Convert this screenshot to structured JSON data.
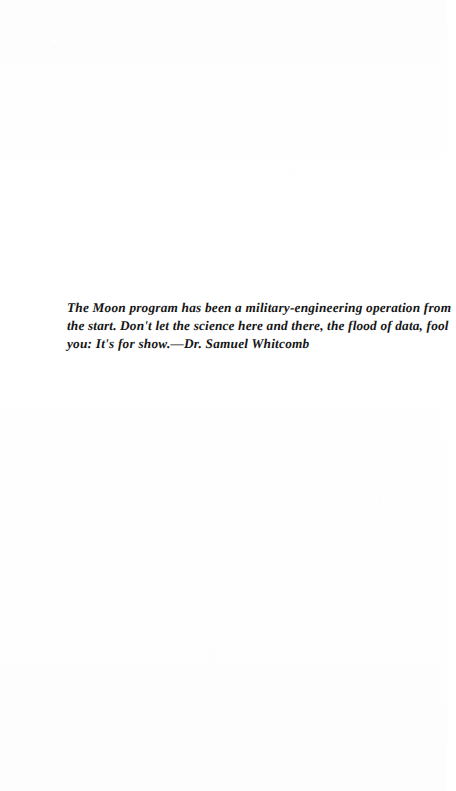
{
  "document": {
    "kind": "scanned-book-page",
    "page_background_color": "#fefefe",
    "text_color": "#151515"
  },
  "epigraph": {
    "full_text": "The Moon program has been a military-engineering operation from the start. Don't let the science here and there, the flood of data, fool you: It's for show.—Dr. Samuel Whitcomb",
    "lines": [
      "The Moon program has been a military-engineering operation from",
      "the start. Don't let the science here and there, the flood of data, fool",
      "you: It's for show.—Dr. Samuel Whitcomb"
    ],
    "quote_body": "The Moon program has been a military-engineering operation from the start. Don't let the science here and there, the flood of data, fool you: It's for show.",
    "attribution": "—Dr. Samuel Whitcomb",
    "attribution_name": "Dr. Samuel Whitcomb"
  }
}
